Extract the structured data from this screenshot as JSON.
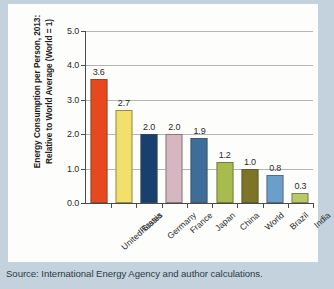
{
  "chart_data": {
    "type": "bar",
    "title": "",
    "xlabel": "",
    "ylabel": "Energy Consumption per Person, 2013: Relative to World Average (World = 1)",
    "categories": [
      "United States",
      "Russia",
      "Germany",
      "France",
      "Japan",
      "China",
      "World",
      "Brazil",
      "India"
    ],
    "values": [
      3.6,
      2.7,
      2.0,
      2.0,
      1.9,
      1.2,
      1.0,
      0.8,
      0.3
    ],
    "value_labels": [
      "3.6",
      "2.7",
      "2.0",
      "2.0",
      "1.9",
      "1.2",
      "1.0",
      "0.8",
      "0.3"
    ],
    "bar_colors": [
      "#e8481e",
      "#f2e06a",
      "#17406e",
      "#d6b6c0",
      "#3c6e99",
      "#a8bc4e",
      "#7d7526",
      "#6a9ecb",
      "#b9c96a"
    ],
    "ylim": [
      0.0,
      5.0
    ],
    "ytick_labels": [
      "0.0",
      "1.0",
      "2.0",
      "3.0",
      "4.0",
      "5.0"
    ],
    "ytick_values": [
      0.0,
      1.0,
      2.0,
      3.0,
      4.0,
      5.0
    ],
    "grid": true,
    "legend": "none"
  },
  "source": {
    "note": "Source: International Energy Agency and author calculations."
  }
}
